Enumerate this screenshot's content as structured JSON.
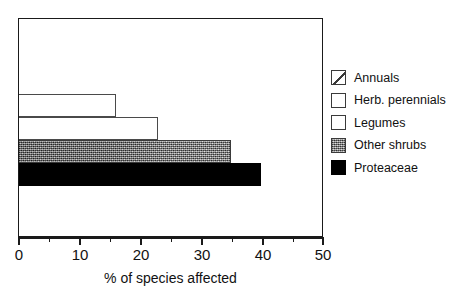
{
  "chart_data": {
    "type": "bar",
    "orientation": "horizontal",
    "title": "",
    "xlabel": "% of species affected",
    "ylabel": "",
    "xlim": [
      0,
      50
    ],
    "xticks": [
      0,
      10,
      20,
      30,
      40,
      50
    ],
    "xtick_labels": [
      "0",
      "10",
      "20",
      "30",
      "40",
      "50"
    ],
    "minor_tick_interval": 5,
    "grid": false,
    "legend_position": "right",
    "categories": [
      "Annuals",
      "Herb. perennials",
      "Legumes",
      "Other shrubs",
      "Proteaceae"
    ],
    "values": [
      0,
      16,
      23,
      35,
      40
    ],
    "bars": [
      {
        "label": "Annuals",
        "value": 0,
        "fill": "diagonal-hatch",
        "visible": false
      },
      {
        "label": "Herb. perennials",
        "value": 16,
        "fill": "white",
        "visible": true
      },
      {
        "label": "Legumes",
        "value": 23,
        "fill": "white",
        "visible": true
      },
      {
        "label": "Other shrubs",
        "value": 35,
        "fill": "gray-speckle",
        "visible": true
      },
      {
        "label": "Proteaceae",
        "value": 40,
        "fill": "black",
        "visible": true
      }
    ],
    "legend": [
      {
        "label": "Annuals",
        "swatch": "diagonal-hatch"
      },
      {
        "label": "Herb. perennials",
        "swatch": "white"
      },
      {
        "label": "Legumes",
        "swatch": "white"
      },
      {
        "label": "Other shrubs",
        "swatch": "gray-speckle"
      },
      {
        "label": "Proteaceae",
        "swatch": "black"
      }
    ],
    "colors": {
      "frame": "#1a1a1a",
      "bar_outline": "#4a4a4a",
      "bar_black": "#000000",
      "bar_speckle": "#b4b4b4",
      "background": "#ffffff"
    }
  }
}
